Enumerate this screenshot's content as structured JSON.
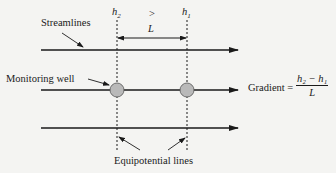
{
  "labels": {
    "streamlines": "Streamlines",
    "monitoring_well": "Monitoring well",
    "equipotential_lines": "Equipotential lines",
    "h2": "h",
    "h2_sub": "2",
    "h1": "h",
    "h1_sub": "1",
    "greater_than": ">",
    "L": "L"
  },
  "formula": {
    "lhs": "Gradient =",
    "numerator": "h₂ − h₁",
    "denominator": "L"
  },
  "geometry": {
    "streamlines_y": [
      50,
      90,
      128
    ],
    "equipotential_x": [
      117,
      187
    ],
    "well_radius": 7
  },
  "colors": {
    "line": "#1a1a1a",
    "well_fill": "#b9b9b9",
    "background": "#f4f4f2"
  }
}
